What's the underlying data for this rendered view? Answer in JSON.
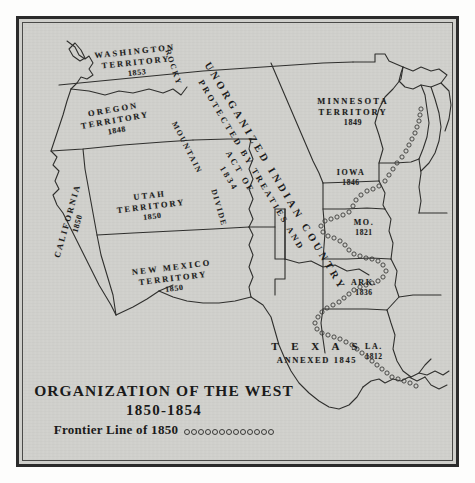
{
  "map": {
    "title_line1": "ORGANIZATION OF THE WEST",
    "title_line2": "1850-1854",
    "legend_label": "Frontier Line of 1850",
    "legend_symbol": "open-circle-chain",
    "legend_dot_count": 13,
    "paper_color": "#d2d2ce",
    "ink_color": "#1c1c1c",
    "border_color": "#2b2b2b"
  },
  "big_label": {
    "line1": "UNORGANIZED INDIAN COUNTRY",
    "line2": "PROTECTED BY TREATIES AND",
    "line3": "ACT OF",
    "line4": "1834"
  },
  "divide": {
    "words": [
      "ROCKY",
      "MOUNTAIN",
      "DIVIDE"
    ]
  },
  "territories": [
    {
      "id": "washington",
      "name_line1": "WASHINGTON",
      "name_line2": "TERRITORY",
      "year": "1853"
    },
    {
      "id": "oregon",
      "name_line1": "OREGON",
      "name_line2": "TERRITORY",
      "year": "1848"
    },
    {
      "id": "utah",
      "name_line1": "UTAH",
      "name_line2": "TERRITORY",
      "year": "1850"
    },
    {
      "id": "new-mexico",
      "name_line1": "NEW MEXICO",
      "name_line2": "TERRITORY",
      "year": "1850"
    },
    {
      "id": "minnesota",
      "name_line1": "MINNESOTA",
      "name_line2": "TERRITORY",
      "year": "1849"
    },
    {
      "id": "california",
      "name_line1": "CALIFORNIA",
      "name_line2": "",
      "year": "1850"
    }
  ],
  "states": [
    {
      "id": "iowa",
      "name": "IOWA",
      "year": "1846"
    },
    {
      "id": "missouri",
      "name": "MO.",
      "year": "1821"
    },
    {
      "id": "arkansas",
      "name": "ARK.",
      "year": "1836"
    },
    {
      "id": "louisiana",
      "name": "LA.",
      "year": "1812"
    }
  ],
  "texas": {
    "name": "T E X A S",
    "status": "ANNEXED 1845"
  }
}
